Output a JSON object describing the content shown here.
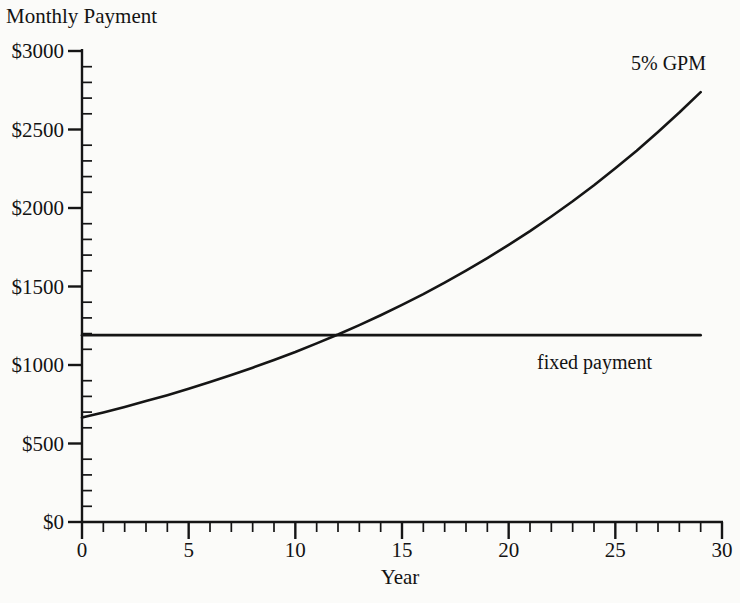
{
  "chart_data": {
    "type": "line",
    "title": "Monthly Payment",
    "xlabel": "Year",
    "ylabel": "Monthly Payment",
    "xlim": [
      0,
      30
    ],
    "ylim": [
      0,
      3000
    ],
    "grid": false,
    "legend_position": "inline-annotations",
    "x_ticks": [
      0,
      5,
      10,
      15,
      20,
      25,
      30
    ],
    "x_tick_labels": [
      "0",
      "5",
      "10",
      "15",
      "20",
      "25",
      "30"
    ],
    "x_minor_tick_step": 1,
    "y_ticks": [
      0,
      500,
      1000,
      1500,
      2000,
      2500,
      3000
    ],
    "y_tick_labels": [
      "$0",
      "$500",
      "$1000",
      "$1500",
      "$2000",
      "$2500",
      "$3000"
    ],
    "y_minor_tick_step": 100,
    "x": [
      0,
      1,
      2,
      3,
      4,
      5,
      6,
      7,
      8,
      9,
      10,
      11,
      12,
      13,
      14,
      15,
      16,
      17,
      18,
      19,
      20,
      21,
      22,
      23,
      24,
      25,
      26,
      27,
      28,
      29
    ],
    "series": [
      {
        "name": "5% GPM",
        "annotation": "5% GPM",
        "values": [
          665,
          698,
          733,
          770,
          808,
          849,
          891,
          936,
          983,
          1032,
          1083,
          1138,
          1194,
          1254,
          1317,
          1383,
          1452,
          1525,
          1601,
          1681,
          1765,
          1853,
          1946,
          2043,
          2145,
          2253,
          2365,
          2484,
          2608,
          2738
        ]
      },
      {
        "name": "fixed payment",
        "annotation": "fixed payment",
        "values": [
          1190,
          1190,
          1190,
          1190,
          1190,
          1190,
          1190,
          1190,
          1190,
          1190,
          1190,
          1190,
          1190,
          1190,
          1190,
          1190,
          1190,
          1190,
          1190,
          1190,
          1190,
          1190,
          1190,
          1190,
          1190,
          1190,
          1190,
          1190,
          1190,
          1190
        ]
      }
    ],
    "annotations": [
      {
        "text": "5% GPM",
        "x": 26.0,
        "y": 2900
      },
      {
        "text": "fixed payment",
        "x": 21.5,
        "y": 1010
      }
    ],
    "crossover": {
      "x": 12.0,
      "y": 1190
    },
    "line_color": "#151515",
    "background_color": "#fbfbf9"
  }
}
